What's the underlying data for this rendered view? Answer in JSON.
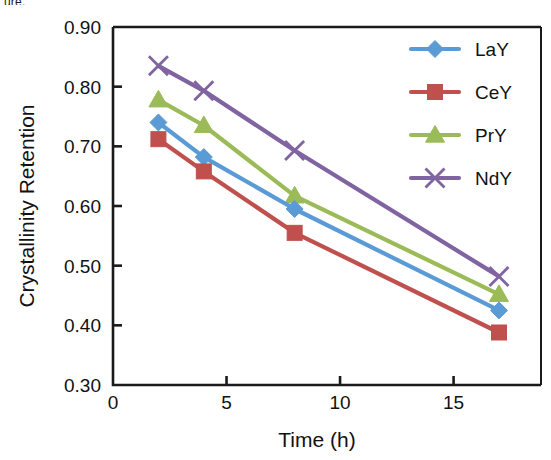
{
  "figure": {
    "clipped_caption": "ure.",
    "background": "#ffffff"
  },
  "chart_data": {
    "type": "line",
    "title": "",
    "xlabel": "Time (h)",
    "ylabel": "Crystallinity  Retention",
    "x": [
      2,
      4,
      8,
      17
    ],
    "xlim": [
      0,
      18.85
    ],
    "ylim": [
      0.3,
      0.9
    ],
    "xticks": [
      0,
      5,
      10,
      15
    ],
    "xticklabels": [
      "0",
      "5",
      "10",
      "15"
    ],
    "yticks": [
      0.3,
      0.4,
      0.5,
      0.6,
      0.7,
      0.8,
      0.9
    ],
    "yticklabels": [
      "0.30",
      "0.40",
      "0.50",
      "0.60",
      "0.70",
      "0.80",
      "0.90"
    ],
    "grid": false,
    "legend_position": "upper right",
    "series": [
      {
        "name": "LaY",
        "color": "#5B9BD5",
        "marker": "diamond",
        "values": [
          0.74,
          0.682,
          0.595,
          0.425
        ]
      },
      {
        "name": "CeY",
        "color": "#C0504D",
        "marker": "square",
        "values": [
          0.712,
          0.658,
          0.555,
          0.388
        ]
      },
      {
        "name": "PrY",
        "color": "#9BBB59",
        "marker": "triangle",
        "values": [
          0.778,
          0.735,
          0.617,
          0.452
        ]
      },
      {
        "name": "NdY",
        "color": "#8064A2",
        "marker": "cross",
        "values": [
          0.835,
          0.793,
          0.693,
          0.482
        ]
      }
    ]
  }
}
